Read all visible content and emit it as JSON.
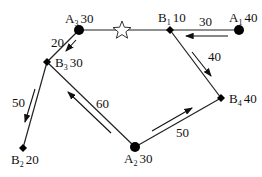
{
  "diagram": {
    "nodes": [
      {
        "id": "A1",
        "letter": "A",
        "sub": "1",
        "value": "40",
        "type": "supply",
        "x": 239,
        "y": 30
      },
      {
        "id": "A2",
        "letter": "A",
        "sub": "2",
        "value": "30",
        "type": "supply",
        "x": 135,
        "y": 147
      },
      {
        "id": "A3",
        "letter": "A",
        "sub": "3",
        "value": "30",
        "type": "supply",
        "x": 79,
        "y": 30
      },
      {
        "id": "B1",
        "letter": "B",
        "sub": "1",
        "value": "10",
        "type": "demand",
        "x": 170,
        "y": 30
      },
      {
        "id": "B2",
        "letter": "B",
        "sub": "2",
        "value": "20",
        "type": "demand",
        "x": 23,
        "y": 148
      },
      {
        "id": "B3",
        "letter": "B",
        "sub": "3",
        "value": "30",
        "type": "demand",
        "x": 47,
        "y": 62
      },
      {
        "id": "B4",
        "letter": "B",
        "sub": "4",
        "value": "40",
        "type": "demand",
        "x": 221,
        "y": 98
      }
    ],
    "star": {
      "x": 122,
      "y": 30
    },
    "edges": [
      [
        "A3",
        "B1"
      ],
      [
        "B1",
        "A1"
      ],
      [
        "B1",
        "B4"
      ],
      [
        "B4",
        "A2"
      ],
      [
        "A2",
        "B3"
      ],
      [
        "B3",
        "A3"
      ],
      [
        "B3",
        "B2"
      ]
    ],
    "flows": [
      {
        "from": "A1",
        "to": "B1",
        "amount": "30"
      },
      {
        "from": "B1",
        "to": "B4",
        "amount": "40"
      },
      {
        "from": "A2",
        "to": "B4",
        "amount": "50"
      },
      {
        "from": "A2",
        "to": "B3",
        "amount": "60"
      },
      {
        "from": "A3",
        "to": "B3",
        "amount": "20"
      },
      {
        "from": "B3",
        "to": "B2",
        "amount": "50"
      }
    ]
  }
}
